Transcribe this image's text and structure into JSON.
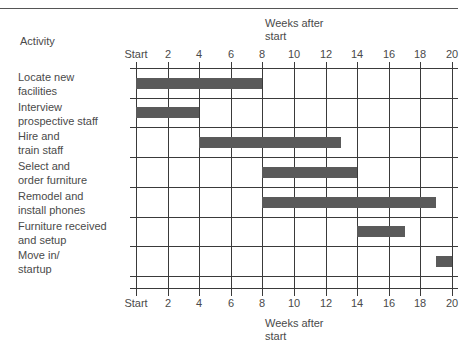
{
  "chart_data": {
    "type": "gantt",
    "title": "",
    "xlabel": "Weeks after start",
    "ylabel": "Activity",
    "x_ticks": [
      "Start",
      "2",
      "4",
      "6",
      "8",
      "10",
      "12",
      "14",
      "16",
      "18",
      "20"
    ],
    "xlim": [
      0,
      20
    ],
    "grid": true,
    "tasks": [
      {
        "name": "Locate new facilities",
        "start": 0,
        "end": 8
      },
      {
        "name": "Interview prospective staff",
        "start": 0,
        "end": 4
      },
      {
        "name": "Hire and train staff",
        "start": 4,
        "end": 13
      },
      {
        "name": "Select and order furniture",
        "start": 8,
        "end": 14
      },
      {
        "name": "Remodel and install phones",
        "start": 8,
        "end": 19
      },
      {
        "name": "Furniture received and setup",
        "start": 14,
        "end": 17
      },
      {
        "name": "Move in/ startup",
        "start": 19,
        "end": 20
      }
    ]
  },
  "labels": {
    "activity_header": "Activity",
    "top_axis_title": "Weeks after\nstart",
    "bottom_axis_title": "Weeks after\nstart"
  },
  "rows": [
    {
      "label": "Locate new\nfacilities"
    },
    {
      "label": "Interview\nprospective staff"
    },
    {
      "label": "Hire and\ntrain staff"
    },
    {
      "label": "Select and\norder furniture"
    },
    {
      "label": "Remodel and\ninstall phones"
    },
    {
      "label": "Furniture received\nand setup"
    },
    {
      "label": "Move in/\nstartup"
    }
  ],
  "ticks": [
    "Start",
    "2",
    "4",
    "6",
    "8",
    "10",
    "12",
    "14",
    "16",
    "18",
    "20"
  ],
  "colors": {
    "bar": "#5a5a5a",
    "grid": "#3a3a3a",
    "text": "#4a4a4a"
  }
}
